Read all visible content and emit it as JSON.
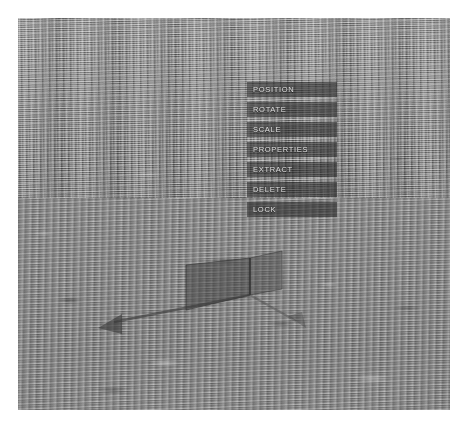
{
  "scene": {
    "name": "3d-terrain-viewport",
    "description": "Grayscale noisy terrain surface rendered in perspective",
    "base_color": "#8e8e8e",
    "horizon_color": "#9a9a9a",
    "foreground_color": "#888888"
  },
  "gizmo": {
    "name": "transform-gizmo",
    "plane_fill": "#4a4a4a",
    "plane_opacity": 0.55,
    "axis_color": "#3c3c3c",
    "origin": {
      "x": 250,
      "y": 277
    },
    "left_plane": {
      "points": "186,247 250,240 250,277 186,292"
    },
    "right_plane": {
      "points": "250,240 282,232 282,272 250,277"
    },
    "axes": [
      {
        "name": "x-axis-arrow",
        "label": "X",
        "from": {
          "x": 250,
          "y": 277
        },
        "to": {
          "x": 96,
          "y": 308
        },
        "arrow_head": "96,308 116,300 114,318"
      },
      {
        "name": "z-axis-arrow",
        "label": "Z",
        "from": {
          "x": 250,
          "y": 277
        },
        "to": {
          "x": 288,
          "y": 308
        },
        "arrow_head": "288,308 275,300 286,296"
      }
    ]
  },
  "context_menu": {
    "name": "object-context-menu",
    "background_color": "#1c1c1c",
    "background_opacity": 0.52,
    "text_color": "#e8e8e8",
    "items": [
      {
        "id": "position",
        "label": "POSITION"
      },
      {
        "id": "rotate",
        "label": "ROTATE"
      },
      {
        "id": "scale",
        "label": "SCALE"
      },
      {
        "id": "properties",
        "label": "PROPERTIES"
      },
      {
        "id": "extract",
        "label": "EXTRACT"
      },
      {
        "id": "delete",
        "label": "DELETE"
      },
      {
        "id": "lock",
        "label": "LOCK"
      }
    ]
  }
}
